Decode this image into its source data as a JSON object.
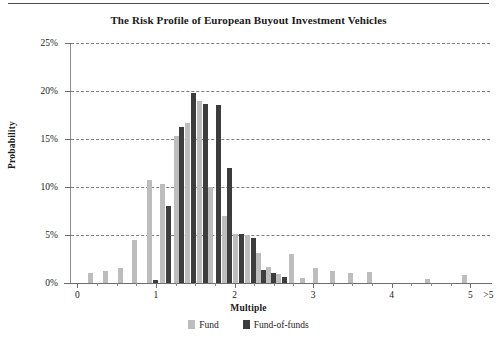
{
  "title": "The Risk Profile of European Buyout Investment Vehicles",
  "axes": {
    "x_title": "Multiple",
    "y_title": "Probability",
    "y_ticks": [
      "0%",
      "5%",
      "10%",
      "15%",
      "20%",
      "25%"
    ],
    "x_ticks": [
      "0",
      "1",
      "2",
      "3",
      "4",
      "5",
      ">5"
    ]
  },
  "legend": {
    "items": [
      {
        "label": "Fund",
        "color": "#bdbdbd",
        "swatch": "fund-swatch-icon"
      },
      {
        "label": "Fund-of-funds",
        "color": "#3d3d3d",
        "swatch": "fund-of-funds-swatch-icon"
      }
    ]
  },
  "colors": {
    "fund": "#bdbdbd",
    "fund_of_funds": "#3d3d3d",
    "gridline": "#7d7d7d",
    "axis": "#6e6e6e",
    "background": "#ffffff",
    "text": "#1a1a1a"
  },
  "chart_data": {
    "type": "bar",
    "title": "The Risk Profile of European Buyout Investment Vehicles",
    "subtitle": "",
    "xlabel": "Multiple",
    "ylabel": "Probability",
    "xlim": [
      -0.08,
      5.25
    ],
    "ylim": [
      0,
      25
    ],
    "y_unit": "%",
    "grid": "horizontal-dashed",
    "legend_position": "bottom-center",
    "x_tick_values": [
      0,
      1,
      2,
      3,
      4,
      5
    ],
    "x_tick_labels": [
      "0",
      "1",
      "2",
      "3",
      "4",
      "5",
      ">5"
    ],
    "y_tick_values": [
      0,
      5,
      10,
      15,
      20,
      25
    ],
    "y_tick_labels": [
      "0%",
      "5%",
      "10%",
      "15%",
      "20%",
      "25%"
    ],
    "series": [
      {
        "name": "Fund",
        "color": "#bdbdbd",
        "points": [
          {
            "x": 0.17,
            "y": 1.0
          },
          {
            "x": 0.36,
            "y": 1.2
          },
          {
            "x": 0.55,
            "y": 1.6
          },
          {
            "x": 0.73,
            "y": 4.5
          },
          {
            "x": 0.92,
            "y": 10.7
          },
          {
            "x": 1.08,
            "y": 10.3
          },
          {
            "x": 1.26,
            "y": 15.3
          },
          {
            "x": 1.4,
            "y": 16.7
          },
          {
            "x": 1.56,
            "y": 19.0
          },
          {
            "x": 1.7,
            "y": 10.0
          },
          {
            "x": 1.87,
            "y": 7.0
          },
          {
            "x": 2.01,
            "y": 5.1
          },
          {
            "x": 2.17,
            "y": 5.0
          },
          {
            "x": 2.3,
            "y": 3.1
          },
          {
            "x": 2.43,
            "y": 1.7
          },
          {
            "x": 2.56,
            "y": 0.9
          },
          {
            "x": 2.73,
            "y": 3.0
          },
          {
            "x": 2.86,
            "y": 0.5
          },
          {
            "x": 3.03,
            "y": 1.6
          },
          {
            "x": 3.25,
            "y": 1.2
          },
          {
            "x": 3.47,
            "y": 1.0
          },
          {
            "x": 3.72,
            "y": 1.1
          },
          {
            "x": 4.45,
            "y": 0.4
          },
          {
            "x": 4.92,
            "y": 0.8
          }
        ]
      },
      {
        "name": "Fund-of-funds",
        "color": "#3d3d3d",
        "points": [
          {
            "x": 0.99,
            "y": 0.3
          },
          {
            "x": 1.16,
            "y": 8.0
          },
          {
            "x": 1.33,
            "y": 16.2
          },
          {
            "x": 1.48,
            "y": 19.8
          },
          {
            "x": 1.63,
            "y": 18.6
          },
          {
            "x": 1.79,
            "y": 18.5
          },
          {
            "x": 1.94,
            "y": 12.0
          },
          {
            "x": 2.09,
            "y": 5.1
          },
          {
            "x": 2.24,
            "y": 4.7
          },
          {
            "x": 2.37,
            "y": 1.4
          },
          {
            "x": 2.5,
            "y": 1.0
          },
          {
            "x": 2.63,
            "y": 0.6
          }
        ]
      }
    ]
  }
}
